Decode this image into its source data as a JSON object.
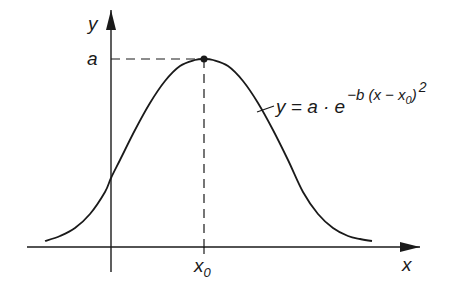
{
  "figure": {
    "y_axis_label": "y",
    "x_axis_label": "x",
    "peak_label": "a",
    "center_label_main": "x",
    "center_label_sub": "0",
    "equation": {
      "lhs": "y = a · e",
      "exp_main": "−b (x − x",
      "exp_sub": "0",
      "exp_close": ")",
      "exp_power": "2",
      "full_text": "y = a · e^(−b(x − x0)^2)"
    }
  },
  "colors": {
    "ink": "#1a1a1a",
    "background": "#ffffff"
  },
  "chart_data": {
    "type": "line",
    "title": "",
    "xlabel": "x",
    "ylabel": "y",
    "annotations": [
      {
        "text": "a",
        "target": "peak height",
        "style": "dashed horizontal guide to y-axis"
      },
      {
        "text": "x0",
        "target": "peak position",
        "style": "dashed vertical guide to x-axis"
      },
      {
        "text": "y = a·e^(−b(x−x0)^2)",
        "target": "curve",
        "style": "leader line"
      }
    ],
    "peak": {
      "x": "x0",
      "y": "a"
    },
    "grid": false,
    "legend": null,
    "axes_px": {
      "x_axis": {
        "y": 247,
        "x_start": 27,
        "x_end": 420
      },
      "y_axis": {
        "x": 111,
        "y_start": 272,
        "y_end": 10
      }
    },
    "peak_px": {
      "x": 204,
      "y": 59
    },
    "curve_points_px": [
      [
        45,
        241
      ],
      [
        60,
        236
      ],
      [
        75,
        228
      ],
      [
        90,
        214
      ],
      [
        105,
        192
      ],
      [
        111,
        178
      ],
      [
        120,
        160
      ],
      [
        135,
        130
      ],
      [
        150,
        103
      ],
      [
        165,
        81
      ],
      [
        180,
        66
      ],
      [
        195,
        60
      ],
      [
        204,
        59
      ],
      [
        213,
        60
      ],
      [
        228,
        66
      ],
      [
        243,
        81
      ],
      [
        258,
        103
      ],
      [
        273,
        130
      ],
      [
        288,
        160
      ],
      [
        303,
        192
      ],
      [
        318,
        214
      ],
      [
        333,
        228
      ],
      [
        348,
        236
      ],
      [
        360,
        239
      ],
      [
        372,
        241
      ]
    ]
  }
}
